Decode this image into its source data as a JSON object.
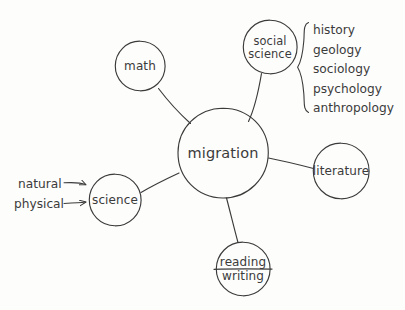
{
  "diagram": {
    "type": "concept-map",
    "title_node": "migration",
    "style": "hand-drawn pencil sketch on white paper",
    "stroke_color": "#3b3b3b",
    "background_color": "#fdfdfc",
    "center": {
      "label": "migration",
      "cx": 223,
      "cy": 153,
      "r": 45
    },
    "nodes": [
      {
        "id": "math",
        "label": "math",
        "cx": 140,
        "cy": 66,
        "r": 25,
        "lines": [
          "math"
        ]
      },
      {
        "id": "social-science",
        "label": "social science",
        "cx": 270,
        "cy": 47,
        "r": 27,
        "lines": [
          "social",
          "science"
        ]
      },
      {
        "id": "literature",
        "label": "literature",
        "cx": 341,
        "cy": 171,
        "r": 28,
        "lines": [
          "literature"
        ]
      },
      {
        "id": "reading-writing",
        "label": "reading / writing",
        "cx": 243,
        "cy": 269,
        "r": 27,
        "lines": [
          "reading",
          "writing"
        ]
      },
      {
        "id": "science",
        "label": "science",
        "cx": 115,
        "cy": 200,
        "r": 26,
        "lines": [
          "science"
        ]
      }
    ],
    "brace_group": {
      "attached_to": "social-science",
      "items": [
        "history",
        "geology",
        "sociology",
        "psychology",
        "anthropology"
      ],
      "x": 313,
      "y_start": 30,
      "line_spacing": 19.5,
      "brace_x": 303,
      "brace_top": 22,
      "brace_bottom": 113
    },
    "side_notes": [
      {
        "label": "natural",
        "x": 18,
        "y": 184,
        "arrow_to": "science"
      },
      {
        "label": "physical",
        "x": 14,
        "y": 204,
        "arrow_to": "science"
      }
    ]
  }
}
